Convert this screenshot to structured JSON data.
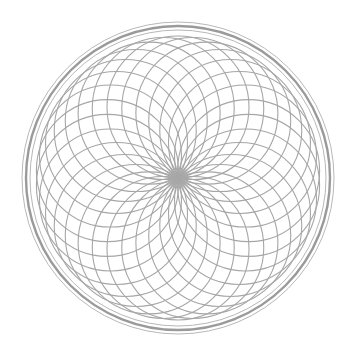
{
  "figure": {
    "type": "rosette",
    "center": [
      178,
      178
    ],
    "petal_count": 30,
    "petal_circle_radius": 71,
    "rings": [
      {
        "r": 156,
        "stroke": "#b8b8b8",
        "width": 1
      },
      {
        "r": 152,
        "stroke": "#9a9a9a",
        "width": 2.4
      },
      {
        "r": 148,
        "stroke": "#b8b8b8",
        "width": 1
      }
    ],
    "colors": {
      "background": "#ffffff",
      "line": "#a6a6a6",
      "center": "#aaaaaa"
    }
  }
}
